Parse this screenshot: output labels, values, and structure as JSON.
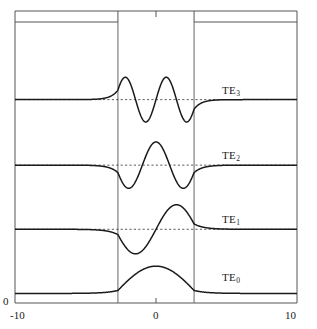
{
  "figure": {
    "kind": "waveguide-te-mode-profiles",
    "background_color": "#ffffff",
    "curve_color": "#1a1a1a",
    "frame_color": "#555555",
    "dashed_color": "#333333"
  },
  "axes": {
    "x_ticks": [
      {
        "label": "-10",
        "value": -10
      },
      {
        "label": "0",
        "value": 0
      },
      {
        "label": "10",
        "value": 10
      }
    ],
    "y_origin_label": "0",
    "xlim": [
      -10,
      10
    ],
    "x_tick_marks": [
      0
    ]
  },
  "index_profile": {
    "core_left": -2.7,
    "core_right": 2.7,
    "cladding_level_label": "",
    "core_level_label": ""
  },
  "modes": [
    {
      "label_text": "TE",
      "order": "3",
      "name": "TE3"
    },
    {
      "label_text": "TE",
      "order": "2",
      "name": "TE2"
    },
    {
      "label_text": "TE",
      "order": "1",
      "name": "TE1"
    },
    {
      "label_text": "TE",
      "order": "0",
      "name": "TE0"
    }
  ],
  "chart_data": {
    "type": "line",
    "title": "",
    "xlabel": "",
    "ylabel": "",
    "xlim": [
      -10,
      10
    ],
    "ylim": [
      0,
      1
    ],
    "grid": false,
    "legend": "inline-right",
    "x_tick_labels": [
      "-10",
      "0",
      "10"
    ],
    "x_tick_values": [
      -10,
      0,
      10
    ],
    "y_tick_labels": [
      "0"
    ],
    "core_boundaries": [
      -2.7,
      2.7
    ],
    "series": [
      {
        "name": "TE3",
        "label": "TE3",
        "baseline": 0.745,
        "nodes": 3,
        "extrema_x": [
          -2.05,
          -0.72,
          0.72,
          2.05
        ],
        "extrema_sign": [
          1,
          -1,
          1,
          -1
        ],
        "amplitude": 0.082,
        "decay_outside": true
      },
      {
        "name": "TE2",
        "label": "TE2",
        "baseline": 0.505,
        "nodes": 2,
        "extrema_x": [
          -1.55,
          0.0,
          1.55
        ],
        "extrema_sign": [
          -1,
          1,
          -1
        ],
        "amplitude": 0.085,
        "decay_outside": true
      },
      {
        "name": "TE1",
        "label": "TE1",
        "baseline": 0.27,
        "nodes": 1,
        "extrema_x": [
          -1.35,
          1.35
        ],
        "extrema_sign": [
          -1,
          1
        ],
        "amplitude": 0.09,
        "decay_outside": true
      },
      {
        "name": "TE0",
        "label": "TE0",
        "baseline": 0.035,
        "nodes": 0,
        "extrema_x": [
          0.0
        ],
        "extrema_sign": [
          1
        ],
        "amplitude": 0.1,
        "decay_outside": true
      }
    ]
  }
}
